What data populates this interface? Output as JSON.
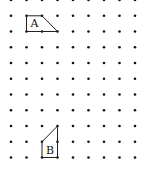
{
  "grid": {
    "type": "dot-grid",
    "columns_x": [
      11,
      26.5,
      42,
      57.5,
      73,
      88.5,
      104,
      119.5,
      135
    ],
    "rows_y": [
      0,
      15.8,
      31.5,
      47.3,
      63,
      78.8,
      94.5,
      110.3,
      126,
      141.8,
      157.5
    ],
    "dot_color": "#111111"
  },
  "shapes": [
    {
      "label": "A",
      "kind": "trapezium",
      "vertices_grid": [
        [
          1,
          1
        ],
        [
          2,
          1
        ],
        [
          3,
          2
        ],
        [
          1,
          2
        ]
      ],
      "stroke": "#222222"
    },
    {
      "label": "B",
      "kind": "trapezium",
      "vertices_grid": [
        [
          2,
          9
        ],
        [
          3,
          8
        ],
        [
          3,
          10
        ],
        [
          2,
          10
        ]
      ],
      "stroke": "#222222"
    }
  ]
}
